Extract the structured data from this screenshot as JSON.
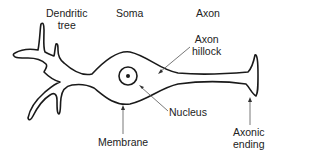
{
  "labels": {
    "dendritic_tree": [
      "Dendritic",
      "tree"
    ],
    "soma": "Soma",
    "axon": "Axon",
    "axon_hillock": [
      "Axon",
      "hillock"
    ],
    "nucleus": "Nucleus",
    "membrane": "Membrane",
    "axonic_ending": [
      "Axonic",
      "ending"
    ]
  },
  "colors": {
    "outline": "#1a1a1a",
    "pointer": "#555555",
    "text": "#222222",
    "background": "#ffffff"
  }
}
